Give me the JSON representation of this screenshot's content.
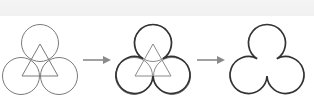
{
  "diagram": {
    "colors": {
      "background": "#ffffff",
      "top_band": "#f2f2f2",
      "thin_stroke": "#7a7a7a",
      "bold_stroke": "#333333",
      "arrow": "#8a8a8a"
    },
    "steps": [
      {
        "id": "step-1",
        "label": "three-circles-with-triangle",
        "offset_x": 0,
        "circles": [
          {
            "cx": 40,
            "cy": 43,
            "r": 18.5
          },
          {
            "cx": 21,
            "cy": 76,
            "r": 18.5
          },
          {
            "cx": 59,
            "cy": 76,
            "r": 18.5
          }
        ],
        "triangle": [
          [
            40,
            44
          ],
          [
            22,
            76
          ],
          [
            58,
            76
          ]
        ],
        "style": "thin"
      },
      {
        "id": "step-2",
        "label": "outer-arcs-emphasized",
        "offset_x": 113,
        "style": "bold-outline"
      },
      {
        "id": "step-3",
        "label": "trefoil-result",
        "offset_x": 227,
        "style": "outline-only"
      }
    ],
    "arrows": [
      {
        "x1": 83,
        "x2": 110,
        "y": 60
      },
      {
        "x1": 197,
        "x2": 224,
        "y": 60
      }
    ]
  }
}
